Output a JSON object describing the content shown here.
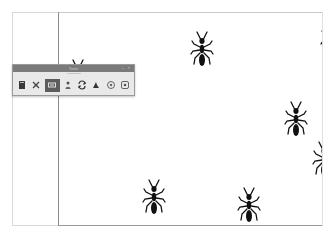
{
  "app": {
    "toolbar": {
      "title": "Tools",
      "controls": [
        "minimize",
        "close"
      ],
      "selected_index": 2,
      "tools": [
        {
          "name": "document-tool",
          "icon": "document-icon"
        },
        {
          "name": "scatter-tool",
          "icon": "scatter-icon"
        },
        {
          "name": "move-tool",
          "icon": "move-icon"
        },
        {
          "name": "person-tool",
          "icon": "person-icon"
        },
        {
          "name": "rotate-tool",
          "icon": "rotate-icon"
        },
        {
          "name": "bug-tool",
          "icon": "bug-icon"
        },
        {
          "name": "eye-tool",
          "icon": "eye-icon"
        },
        {
          "name": "target-tool",
          "icon": "target-icon"
        }
      ]
    },
    "canvas": {
      "ants": [
        {
          "x": 128,
          "y": 18,
          "rot": 0
        },
        {
          "x": 258,
          "y": 8,
          "rot": 0,
          "clipped": true
        },
        {
          "x": 4,
          "y": 46,
          "rot": 0,
          "clipped": true
        },
        {
          "x": 222,
          "y": 88,
          "rot": 0
        },
        {
          "x": 250,
          "y": 128,
          "rot": 0,
          "clipped": true
        },
        {
          "x": 80,
          "y": 166,
          "rot": 0
        },
        {
          "x": 175,
          "y": 174,
          "rot": 0
        }
      ]
    },
    "colors": {
      "toolbar_title": "#7a7a7a",
      "toolbar_bg": "#e9e9e9",
      "selected_tool": "#5c5c5c",
      "ant": "#111111"
    }
  }
}
